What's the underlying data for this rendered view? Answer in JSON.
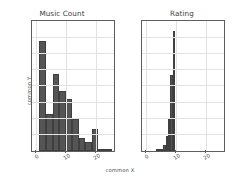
{
  "figure": {
    "shared_xlabel": "common X",
    "shared_ylabel": "common Y",
    "background": "#ffffff",
    "bar_color": "#555555",
    "grid_color": "#e2e2e2",
    "axis_color": "#5e5e5e"
  },
  "chart_data": [
    {
      "type": "bar",
      "title": "Music Count",
      "xlabel": "common X",
      "ylabel": "common Y",
      "xlim": [
        -1.5,
        26.0
      ],
      "ylim": [
        0,
        400
      ],
      "xticks": [
        0,
        10,
        20
      ],
      "xtick_labels": [
        "0",
        "10",
        "20"
      ],
      "yticks": [
        0,
        50,
        100,
        150,
        200,
        250,
        300,
        350,
        400
      ],
      "ytick_labels": [
        "0",
        "50",
        "100",
        "150",
        "200",
        "250",
        "300",
        "350",
        "400"
      ],
      "grid": true,
      "legend": "none",
      "bin_edges": [
        1.0,
        3.2,
        5.4,
        7.6,
        9.8,
        12.0,
        14.2,
        16.4,
        18.6,
        20.8,
        23.0,
        25.2
      ],
      "values": [
        340,
        113,
        238,
        185,
        160,
        100,
        40,
        27,
        68,
        5,
        6
      ],
      "categories": [
        "1.0-3.2",
        "3.2-5.4",
        "5.4-7.6",
        "7.6-9.8",
        "9.8-12.0",
        "12.0-14.2",
        "14.2-16.4",
        "16.4-18.6",
        "18.6-20.8",
        "20.8-23.0",
        "23.0-25.2"
      ]
    },
    {
      "type": "bar",
      "title": "Rating",
      "xlabel": "common X",
      "ylabel": "common Y",
      "xlim": [
        -1.5,
        26.0
      ],
      "ylim": [
        0,
        400
      ],
      "xticks": [
        0,
        10,
        20
      ],
      "xtick_labels": [
        "0",
        "10",
        "20"
      ],
      "yticks": [
        0,
        50,
        100,
        150,
        200,
        250,
        300,
        350,
        400
      ],
      "ytick_labels": [
        "",
        "",
        "",
        "",
        "",
        "",
        "",
        "",
        ""
      ],
      "grid": true,
      "legend": "none",
      "bin_edges": [
        3.2,
        4.0,
        4.8,
        5.6,
        6.4,
        7.2,
        8.0,
        8.8,
        9.6
      ],
      "values": [
        2,
        2,
        3,
        20,
        45,
        100,
        235,
        370
      ],
      "categories": [
        "3.2-4.0",
        "4.0-4.8",
        "4.8-5.6",
        "5.6-6.4",
        "6.4-7.2",
        "7.2-8.0",
        "8.0-8.8",
        "8.8-9.6"
      ]
    }
  ]
}
